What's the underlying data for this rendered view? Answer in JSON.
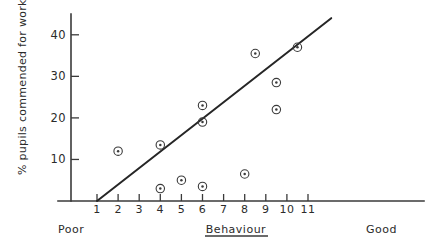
{
  "chart_data": {
    "type": "scatter",
    "title": "",
    "xlabel": "Behaviour",
    "ylabel": "% pupils commended for work",
    "xlim": [
      0,
      13.5
    ],
    "ylim": [
      0,
      45
    ],
    "grid": false,
    "legend": null,
    "x_ticks": [
      1,
      2,
      3,
      4,
      5,
      6,
      7,
      8,
      9,
      10,
      11
    ],
    "x_tick_labels": [
      "1",
      "2",
      "3",
      "4",
      "5",
      "6",
      "7",
      "8",
      "9",
      "10",
      "11"
    ],
    "y_ticks": [
      10,
      20,
      30,
      40
    ],
    "y_tick_labels": [
      "10",
      "20",
      "30",
      "40"
    ],
    "x_axis_low_label": "Poor",
    "x_axis_high_label": "Good",
    "x_axis_title_underlined": true,
    "points": [
      {
        "x": 2.0,
        "y": 12.0
      },
      {
        "x": 4.0,
        "y": 13.5
      },
      {
        "x": 4.0,
        "y": 3.0
      },
      {
        "x": 5.0,
        "y": 5.0
      },
      {
        "x": 6.0,
        "y": 3.5
      },
      {
        "x": 6.0,
        "y": 23.0
      },
      {
        "x": 6.0,
        "y": 19.0
      },
      {
        "x": 8.0,
        "y": 6.5
      },
      {
        "x": 8.5,
        "y": 35.5
      },
      {
        "x": 9.5,
        "y": 28.5
      },
      {
        "x": 9.5,
        "y": 22.0
      },
      {
        "x": 10.5,
        "y": 37.0
      }
    ],
    "fit_line": {
      "type": "linear-regression",
      "x_start": 1.0,
      "y_start": 0.0,
      "x_end": 12.1,
      "y_end": 44.0
    }
  }
}
